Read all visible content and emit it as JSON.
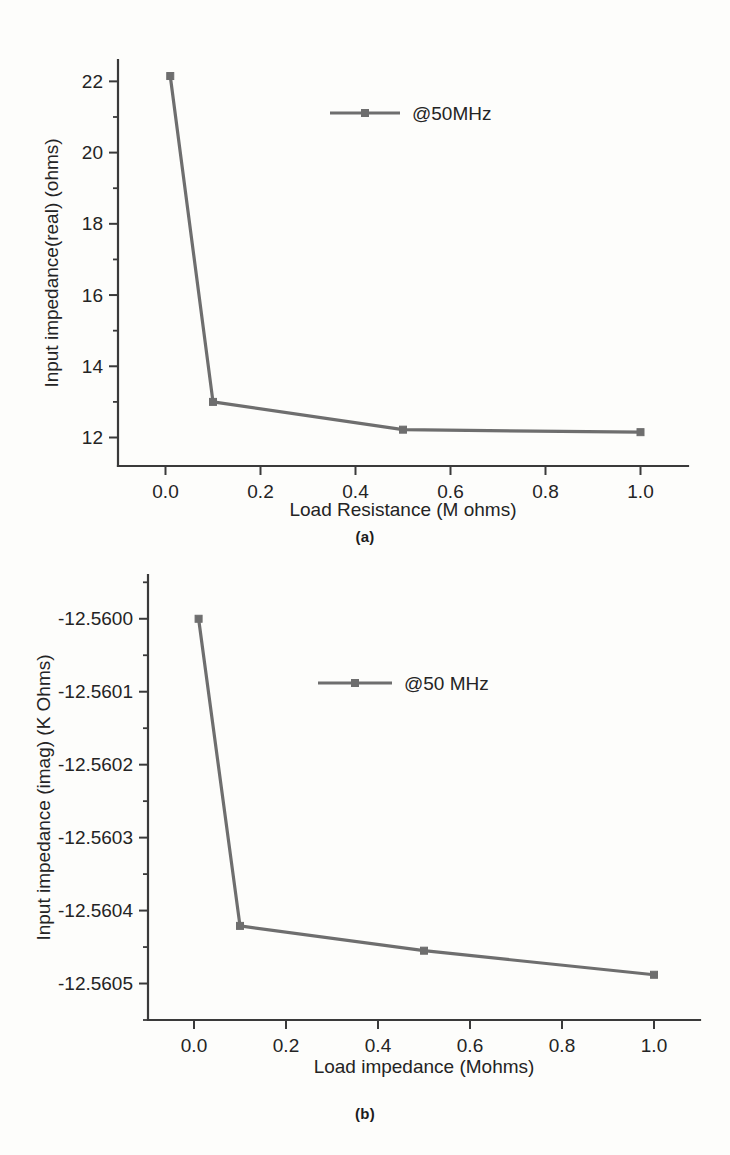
{
  "figure": {
    "caption_a": "(a)",
    "caption_b": "(b)",
    "bottom_note_truncated": ""
  },
  "style": {
    "series_color": "#6e6e6e",
    "axis_color": "#3a3a3a",
    "background": "#fdfdfb"
  },
  "chart_data": [
    {
      "type": "line",
      "panel": "a",
      "title": "",
      "xlabel": "Load Resistance (M ohms)",
      "ylabel": "Input impedance(real) (ohms)",
      "xlim": [
        -0.1,
        1.1
      ],
      "ylim": [
        11.2,
        22.6
      ],
      "xticks": [
        "0.0",
        "0.2",
        "0.4",
        "0.6",
        "0.8",
        "1.0"
      ],
      "xtickvalues": [
        0.0,
        0.2,
        0.4,
        0.6,
        0.8,
        1.0
      ],
      "yticks": [
        "12",
        "14",
        "16",
        "18",
        "20",
        "22"
      ],
      "ytickvalues": [
        12,
        14,
        16,
        18,
        20,
        22
      ],
      "minor_ticks": true,
      "grid": false,
      "legend_position": "upper-center",
      "series": [
        {
          "name": "@50MHz",
          "marker": "square",
          "x": [
            0.01,
            0.1,
            0.5,
            1.0
          ],
          "values": [
            22.15,
            13.0,
            12.22,
            12.15
          ]
        }
      ]
    },
    {
      "type": "line",
      "panel": "b",
      "title": "",
      "xlabel": "Load impedance (Mohms)",
      "ylabel": "Input impedance (imag) (K Ohms)",
      "xlim": [
        -0.1,
        1.1
      ],
      "ylim": [
        -12.56055,
        -12.55994
      ],
      "xticks": [
        "0.0",
        "0.2",
        "0.4",
        "0.6",
        "0.8",
        "1.0"
      ],
      "xtickvalues": [
        0.0,
        0.2,
        0.4,
        0.6,
        0.8,
        1.0
      ],
      "yticks": [
        "-12.5605",
        "-12.5604",
        "-12.5603",
        "-12.5602",
        "-12.5601",
        "-12.5600"
      ],
      "ytickvalues": [
        -12.5605,
        -12.5604,
        -12.5603,
        -12.5602,
        -12.5601,
        -12.56
      ],
      "minor_ticks": true,
      "grid": false,
      "legend_position": "upper-center",
      "series": [
        {
          "name": "@50 MHz",
          "marker": "square",
          "x": [
            0.01,
            0.1,
            0.5,
            1.0
          ],
          "values": [
            -12.56,
            -12.560421,
            -12.560455,
            -12.560488
          ]
        }
      ]
    }
  ]
}
